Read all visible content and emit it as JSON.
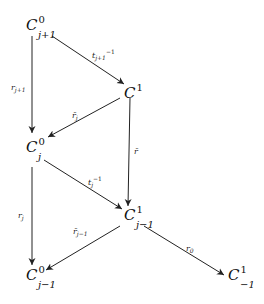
{
  "nodes": {
    "c0_jp1": {
      "base": "C",
      "sup": "0",
      "sub": "j+1"
    },
    "c1": {
      "base": "C",
      "sup": "1",
      "sub": ""
    },
    "c0_j": {
      "base": "C",
      "sup": "0",
      "sub": "j"
    },
    "c1_jm1": {
      "base": "C",
      "sup": "1",
      "sub": "j−1"
    },
    "c0_jm1": {
      "base": "C",
      "sup": "0",
      "sub": "j−1"
    },
    "c1_m1": {
      "base": "C",
      "sup": "1",
      "sub": "−1"
    }
  },
  "arrows": {
    "t_jp1_inv": {
      "base": "t",
      "sub": "j+1",
      "sup": "−1"
    },
    "r_jp1": {
      "base": "r",
      "sub": "j+1",
      "sup": ""
    },
    "rbar_j": {
      "base": "r̄",
      "sub": "j",
      "sup": ""
    },
    "rbar": {
      "base": "r̄",
      "sub": "",
      "sup": ""
    },
    "t_j_inv": {
      "base": "t",
      "sub": "j",
      "sup": "−1"
    },
    "r_j": {
      "base": "r",
      "sub": "j",
      "sup": ""
    },
    "rbar_jm1": {
      "base": "r̄",
      "sub": "j−1",
      "sup": ""
    },
    "r_0": {
      "base": "r",
      "sub": "0",
      "sup": ""
    }
  }
}
